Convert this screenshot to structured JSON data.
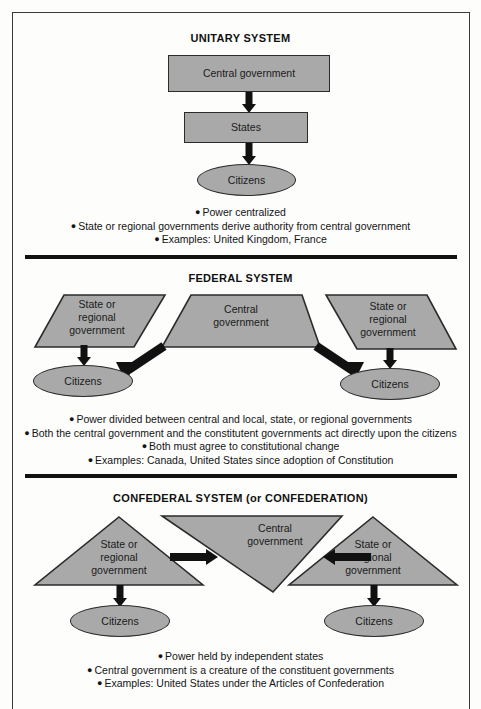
{
  "document": {
    "title": "Systems of Government Comparison Diagram",
    "shape_fill": "#a9a9a9",
    "shape_stroke": "#2b2b2b",
    "arrow_color": "#111111",
    "background": "#fdfdfc"
  },
  "sections": [
    {
      "id": "unitary",
      "title": "UNITARY SYSTEM",
      "nodes": {
        "central": "Central government",
        "states": "States",
        "citizens": "Citizens"
      },
      "bullets": [
        "Power centralized",
        "State or regional governments derive authority from central government",
        "Examples: United Kingdom, France"
      ]
    },
    {
      "id": "federal",
      "title": "FEDERAL SYSTEM",
      "nodes": {
        "state_left": "State or regional government",
        "state_left_lines": [
          "State or",
          "regional",
          "government"
        ],
        "central": "Central government",
        "central_lines": [
          "Central",
          "government"
        ],
        "state_right": "State or regional government",
        "state_right_lines": [
          "State or",
          "regional",
          "government"
        ],
        "citizens_left": "Citizens",
        "citizens_right": "Citizens"
      },
      "bullets": [
        "Power divided between central and local, state, or regional governments",
        "Both the central government and the constitutent governments act directly upon the citizens",
        "Both must agree to constitutional change",
        "Examples: Canada, United States since adoption of Constitution"
      ]
    },
    {
      "id": "confederal",
      "title": "CONFEDERAL SYSTEM (or CONFEDERATION)",
      "nodes": {
        "state_left_lines": [
          "State or",
          "regional",
          "government"
        ],
        "central_lines": [
          "Central",
          "government"
        ],
        "state_right_lines": [
          "State or",
          "regional",
          "government"
        ],
        "citizens_left": "Citizens",
        "citizens_right": "Citizens"
      },
      "bullets": [
        "Power held by independent states",
        "Central government is a creature of the constituent governments",
        "Examples: United States under the Articles of Confederation"
      ]
    }
  ],
  "bullet_marker": "●"
}
